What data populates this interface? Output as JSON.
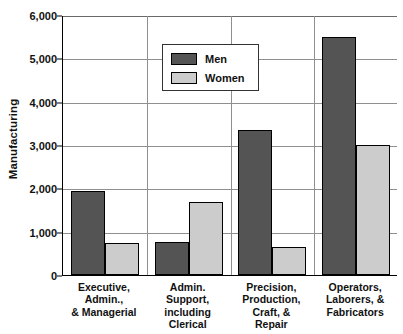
{
  "chart_data": {
    "type": "bar",
    "title": "",
    "subtitle": "",
    "xlabel": "",
    "ylabel": "Manufacturing",
    "ylim": [
      0,
      6000
    ],
    "ytick_values": [
      0,
      1000,
      2000,
      3000,
      4000,
      5000,
      6000
    ],
    "ytick_labels": [
      "0",
      "1,000",
      "2,000",
      "3,000",
      "4,000",
      "5,000",
      "6,000"
    ],
    "grid": true,
    "grid_orientation": "horizontal",
    "legend_position": "upper-left-inside",
    "grouping": "grouped",
    "categories": [
      "Executive,\nAdmin.,\n& Managerial",
      "Admin.\nSupport,\nincluding\nClerical",
      "Precision,\nProduction,\nCraft, &\nRepair",
      "Operators,\nLaborers, &\nFabricators"
    ],
    "category_lines": [
      [
        "Executive,",
        "Admin.,",
        "& Managerial"
      ],
      [
        "Admin.",
        "Support,",
        "including",
        "Clerical"
      ],
      [
        "Precision,",
        "Production,",
        "Craft, &",
        "Repair"
      ],
      [
        "Operators,",
        "Laborers, &",
        "Fabricators"
      ]
    ],
    "series": [
      {
        "name": "Men",
        "color": "#545454",
        "values": [
          1940,
          770,
          3340,
          5500
        ]
      },
      {
        "name": "Women",
        "color": "#cccccc",
        "values": [
          740,
          1680,
          640,
          3010
        ]
      }
    ]
  },
  "legend": {
    "entries": [
      {
        "label": "Men",
        "swatch": "men"
      },
      {
        "label": "Women",
        "swatch": "women"
      }
    ]
  },
  "colors": {
    "men": "#545454",
    "women": "#cccccc",
    "axis": "#000000",
    "grid": "#8f8f8f",
    "text": "#111111",
    "background": "#ffffff"
  }
}
